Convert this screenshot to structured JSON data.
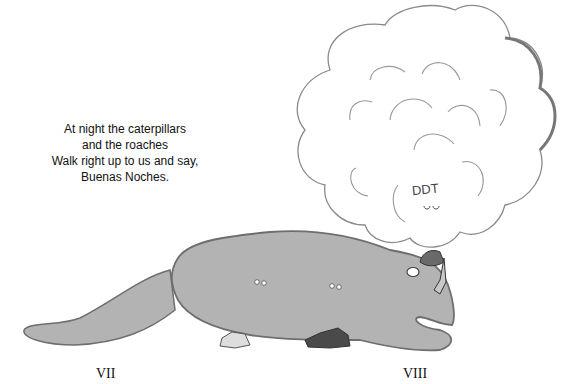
{
  "poem": {
    "lines": [
      "At night the caterpillars",
      "and the roaches",
      "Walk right up to us and say,",
      "Buenas Noches."
    ]
  },
  "illustration": {
    "cloud_text": "DDT",
    "creature": "large gray caterpillar-like creature crouching over a person",
    "colors": {
      "creature_fill": "#b3b3b3",
      "creature_outline": "#6e6e6e",
      "cloud_fill": "#ffffff",
      "cloud_outline": "#8a8a8a",
      "person_dark": "#4a4a4a"
    }
  },
  "labels": {
    "left": "VII",
    "right": "VIII"
  }
}
